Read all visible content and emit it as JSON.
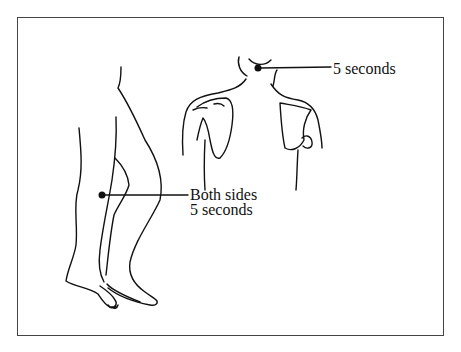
{
  "figure": {
    "annotations": [
      {
        "id": "neck",
        "target": "back of neck",
        "lines": [
          "5 seconds"
        ]
      },
      {
        "id": "knee",
        "target": "back of knee",
        "lines": [
          "Both sides",
          "5 seconds"
        ]
      }
    ]
  },
  "colors": {
    "ink": "#111111",
    "frame": "#444444",
    "background": "#ffffff"
  }
}
